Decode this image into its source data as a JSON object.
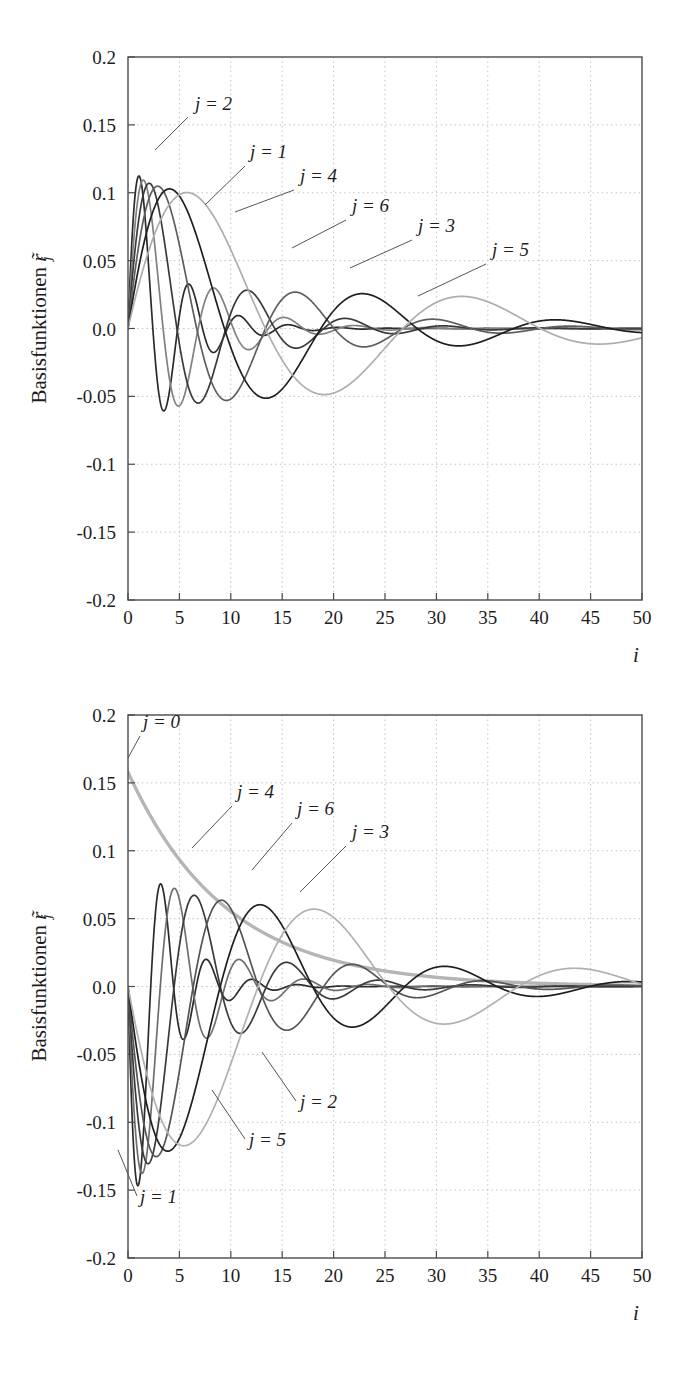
{
  "figure": {
    "width": 686,
    "height": 1383,
    "background": "#ffffff"
  },
  "chart_data": [
    {
      "id": "top",
      "type": "line",
      "title": "",
      "xlabel": "i",
      "ylabel": "Basisfunktionen r̃_j",
      "ylabel_text": "Basisfunktionen",
      "ylabel_symbol": "r",
      "ylabel_subscript": "j",
      "xlim": [
        0,
        50
      ],
      "ylim": [
        -0.2,
        0.2
      ],
      "xticks": [
        0,
        5,
        10,
        15,
        20,
        25,
        30,
        35,
        40,
        45,
        50
      ],
      "xtick_labels": [
        "0",
        "5",
        "10",
        "15",
        "20",
        "25",
        "30",
        "35",
        "40",
        "45",
        "50"
      ],
      "yticks": [
        0.2,
        0.15,
        0.1,
        0.05,
        0.0,
        -0.05,
        -0.1,
        -0.15,
        -0.2
      ],
      "ytick_labels": [
        "0.2",
        "0.15",
        "0.1",
        "0.05",
        "0.0",
        "-0.05",
        "-0.1",
        "-0.15",
        "-0.2"
      ],
      "grid": true,
      "legend_position": "inline-annotations",
      "series": [
        {
          "name": "j = 1",
          "amp": 0.15,
          "freq": 1.3,
          "decay": 0.255,
          "phase": 0.0,
          "color": "#2b2b2b",
          "width": 1.7
        },
        {
          "name": "j = 2",
          "amp": 0.148,
          "freq": 0.92,
          "decay": 0.19,
          "phase": 0.0,
          "color": "#808080",
          "width": 1.7
        },
        {
          "name": "j = 3",
          "amp": 0.146,
          "freq": 0.66,
          "decay": 0.14,
          "phase": 0.0,
          "color": "#3a3a3a",
          "width": 1.7
        },
        {
          "name": "j = 4",
          "amp": 0.144,
          "freq": 0.47,
          "decay": 0.102,
          "phase": 0.0,
          "color": "#5e5e5e",
          "width": 1.7
        },
        {
          "name": "j = 5",
          "amp": 0.142,
          "freq": 0.335,
          "decay": 0.074,
          "phase": 0.0,
          "color": "#1f1f1f",
          "width": 1.7
        },
        {
          "name": "j = 6",
          "amp": 0.14,
          "freq": 0.235,
          "decay": 0.054,
          "phase": 0.0,
          "color": "#adadad",
          "width": 1.7
        }
      ],
      "annotations": [
        {
          "label": "j = 2",
          "text_x": 195,
          "text_y": 110,
          "leader": [
            [
              188,
              117
            ],
            [
              155,
              150
            ]
          ]
        },
        {
          "label": "j = 1",
          "text_x": 250,
          "text_y": 158,
          "leader": [
            [
              245,
              166
            ],
            [
              205,
              205
            ]
          ]
        },
        {
          "label": "j = 4",
          "text_x": 300,
          "text_y": 182,
          "leader": [
            [
              294,
              190
            ],
            [
              235,
              212
            ]
          ]
        },
        {
          "label": "j = 6",
          "text_x": 352,
          "text_y": 212,
          "leader": [
            [
              346,
              220
            ],
            [
              292,
              248
            ]
          ]
        },
        {
          "label": "j = 3",
          "text_x": 418,
          "text_y": 232,
          "leader": [
            [
              412,
              240
            ],
            [
              350,
              268
            ]
          ]
        },
        {
          "label": "j = 5",
          "text_x": 492,
          "text_y": 256,
          "leader": [
            [
              486,
              264
            ],
            [
              418,
              296
            ]
          ]
        }
      ]
    },
    {
      "id": "bottom",
      "type": "line",
      "title": "",
      "xlabel": "i",
      "ylabel": "Basisfunktionen r̃_j",
      "ylabel_text": "Basisfunktionen",
      "ylabel_symbol": "r",
      "ylabel_subscript": "j",
      "xlim": [
        0,
        50
      ],
      "ylim": [
        -0.2,
        0.2
      ],
      "xticks": [
        0,
        5,
        10,
        15,
        20,
        25,
        30,
        35,
        40,
        45,
        50
      ],
      "xtick_labels": [
        "0",
        "5",
        "10",
        "15",
        "20",
        "25",
        "30",
        "35",
        "40",
        "45",
        "50"
      ],
      "yticks": [
        0.2,
        0.15,
        0.1,
        0.05,
        0.0,
        -0.05,
        -0.1,
        -0.15,
        -0.2
      ],
      "ytick_labels": [
        "0.2",
        "0.15",
        "0.1",
        "0.05",
        "0.0",
        "-0.05",
        "-0.1",
        "-0.15",
        "-0.2"
      ],
      "grid": true,
      "legend_position": "inline-annotations",
      "series": [
        {
          "name": "j = 0",
          "amp": 0.158,
          "freq": 0.0,
          "decay": 0.105,
          "phase": 1.5708,
          "color": "#b5b5b5",
          "width": 3.4,
          "monotonic": true
        },
        {
          "name": "j = 1",
          "amp": 0.2,
          "freq": 1.42,
          "decay": 0.3,
          "phase": 3.1416,
          "color": "#2b2b2b",
          "width": 1.7
        },
        {
          "name": "j = 2",
          "amp": 0.186,
          "freq": 1.0,
          "decay": 0.205,
          "phase": 3.1416,
          "color": "#6e6e6e",
          "width": 1.7
        },
        {
          "name": "j = 3",
          "amp": 0.178,
          "freq": 0.7,
          "decay": 0.148,
          "phase": 3.1416,
          "color": "#3a3a3a",
          "width": 1.7
        },
        {
          "name": "j = 4",
          "amp": 0.172,
          "freq": 0.495,
          "decay": 0.107,
          "phase": 3.1416,
          "color": "#555555",
          "width": 1.7
        },
        {
          "name": "j = 5",
          "amp": 0.168,
          "freq": 0.35,
          "decay": 0.078,
          "phase": 3.1416,
          "color": "#1f1f1f",
          "width": 1.7
        },
        {
          "name": "j = 6",
          "amp": 0.164,
          "freq": 0.248,
          "decay": 0.057,
          "phase": 3.1416,
          "color": "#b0b0b0",
          "width": 1.7
        }
      ],
      "annotations": [
        {
          "label": "j = 0",
          "text_x": 143,
          "text_y": 48,
          "leader": [
            [
              140,
              56
            ],
            [
              128,
              78
            ]
          ]
        },
        {
          "label": "j = 4",
          "text_x": 237,
          "text_y": 118,
          "leader": [
            [
              232,
              126
            ],
            [
              192,
              168
            ]
          ]
        },
        {
          "label": "j = 6",
          "text_x": 297,
          "text_y": 135,
          "leader": [
            [
              292,
              143
            ],
            [
              252,
              190
            ]
          ]
        },
        {
          "label": "j = 3",
          "text_x": 352,
          "text_y": 158,
          "leader": [
            [
              346,
              166
            ],
            [
              300,
              212
            ]
          ]
        },
        {
          "label": "j = 2",
          "text_x": 300,
          "text_y": 428,
          "leader": [
            [
              296,
              421
            ],
            [
              262,
              372
            ]
          ]
        },
        {
          "label": "j = 5",
          "text_x": 249,
          "text_y": 466,
          "leader": [
            [
              245,
              459
            ],
            [
              212,
              410
            ]
          ]
        },
        {
          "label": "j = 1",
          "text_x": 140,
          "text_y": 523,
          "leader": [
            [
              137,
              516
            ],
            [
              118,
              470
            ]
          ]
        }
      ]
    }
  ],
  "axes_geometry": {
    "top": {
      "plot_left": 128,
      "plot_top": 57,
      "plot_right": 642,
      "plot_bottom": 600
    },
    "bottom": {
      "plot_left": 128,
      "plot_top": 35,
      "plot_right": 642,
      "plot_bottom": 578
    }
  },
  "colors": {
    "frame": "#4a4a4a",
    "grid": "#b9b9b9",
    "text": "#1d1d1d",
    "leader": "#555555",
    "background": "#ffffff"
  }
}
